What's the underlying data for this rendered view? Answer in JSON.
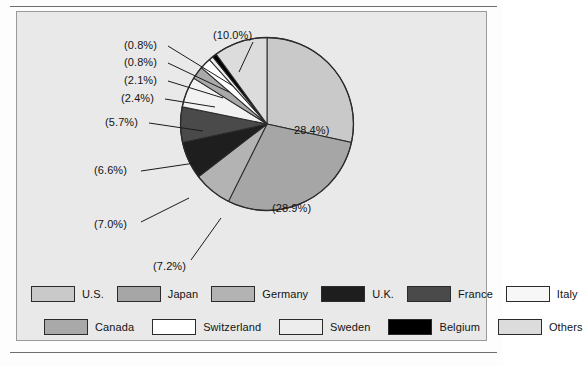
{
  "chart_data": {
    "type": "pie",
    "title": "",
    "xlabel": "",
    "ylabel": "",
    "legend_position": "bottom",
    "grid": false,
    "start_angle_deg": 0,
    "direction": "clockwise",
    "categories": [
      "U.S.",
      "Japan",
      "Germany",
      "U.K.",
      "France",
      "Italy",
      "Canada",
      "Switzerland",
      "Sweden",
      "Belgium",
      "Others"
    ],
    "values": [
      28.4,
      28.9,
      7.2,
      7.0,
      6.6,
      5.7,
      2.4,
      2.1,
      0.8,
      0.8,
      10.0
    ],
    "value_labels": [
      "28.4%)",
      "(28.9%)",
      "(7.2%)",
      "(7.0%)",
      "(6.6%)",
      "(5.7%)",
      "(2.4%)",
      "(2.1%)",
      "(0.8%)",
      "(0.8%)",
      "(10.0%)"
    ],
    "colors": [
      "#c9c9c9",
      "#a6a6a6",
      "#b3b3b3",
      "#1e1e1e",
      "#4a4a4a",
      "#f2f2f2",
      "#a9a9a9",
      "#ffffff",
      "#ededed",
      "#000000",
      "#dcdcdc"
    ],
    "units": "percent"
  },
  "labels": {
    "us": "28.4%)",
    "japan": "(28.9%)",
    "germany": "(7.2%)",
    "uk": "(7.0%)",
    "france": "(6.6%)",
    "italy": "(5.7%)",
    "canada": "(2.4%)",
    "switzerland": "(2.1%)",
    "sweden": "(0.8%)",
    "belgium": "(0.8%)",
    "others": "(10.0%)"
  },
  "legend": {
    "row1": [
      {
        "label": "U.S.",
        "color": "#c9c9c9"
      },
      {
        "label": "Japan",
        "color": "#a6a6a6"
      },
      {
        "label": "Germany",
        "color": "#b3b3b3"
      },
      {
        "label": "U.K.",
        "color": "#1e1e1e"
      },
      {
        "label": "France",
        "color": "#4a4a4a"
      },
      {
        "label": "Italy",
        "color": "#f7f7f7"
      }
    ],
    "row2": [
      {
        "label": "Canada",
        "color": "#a9a9a9"
      },
      {
        "label": "Switzerland",
        "color": "#ffffff"
      },
      {
        "label": "Sweden",
        "color": "#ededed"
      },
      {
        "label": "Belgium",
        "color": "#000000"
      },
      {
        "label": "Others",
        "color": "#dcdcdc"
      }
    ]
  }
}
